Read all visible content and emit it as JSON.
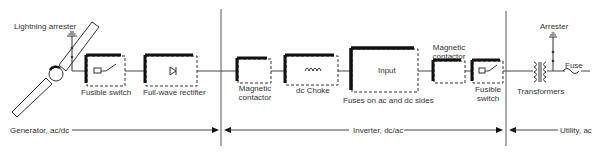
{
  "diagram": {
    "sections": {
      "generator": "Generator, ac/dc",
      "inverter": "Inverter, dc/ac",
      "utility": "Utility, ac"
    },
    "components": {
      "lightning_arrester": "Lightning arrester",
      "fusible_switch_1": "Fusible switch",
      "full_wave_rectifier": "Full-wave rectifier",
      "magnetic_contactor_1_line1": "Magnetic",
      "magnetic_contactor_1_line2": "contactor",
      "dc_choke": "dc Choke",
      "input": "Input",
      "fuses": "Fuses on ac and dc sides",
      "magnetic_contactor_2_line1": "Magnetic",
      "magnetic_contactor_2_line2": "contactor",
      "fusible_switch_2_line1": "Fusible",
      "fusible_switch_2_line2": "switch",
      "transformers": "Transformers",
      "arrester": "Arrester",
      "fuse": "Fuse"
    },
    "colors": {
      "line": "#333333",
      "block_shadow": "#111111",
      "background": "#ffffff"
    }
  }
}
